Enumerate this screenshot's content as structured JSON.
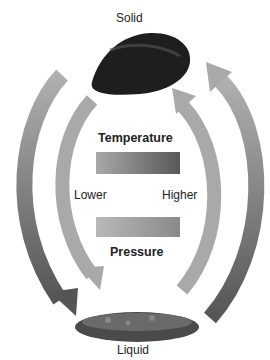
{
  "labels": {
    "top": "Solid",
    "bottom": "Liquid",
    "temperature": "Temperature",
    "pressure": "Pressure",
    "lower": "Lower",
    "higher": "Higher"
  },
  "colors": {
    "arrow_dark": "#5e5e5e",
    "arrow_light": "#a9a9a9",
    "bar_gradient_start": "#a8a8a8",
    "bar_gradient_end": "#5a5a5a"
  }
}
